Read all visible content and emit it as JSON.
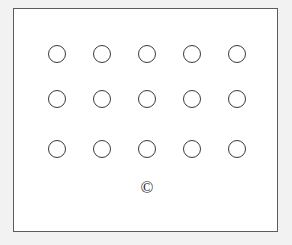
{
  "page": {
    "background_color": "#f2f2f2",
    "width": 292,
    "height": 245
  },
  "frame": {
    "name": "diagram-frame",
    "border_color": "#5c5c5c",
    "fill_color": "#ffffff",
    "left": 13,
    "top": 8,
    "width": 265,
    "height": 224
  },
  "circle_grid": {
    "rows": 3,
    "columns": 5,
    "total_circles": 15,
    "circle_diameter": 18,
    "stroke_color": "#3a3a3a",
    "fill_color": "none",
    "column_centers_x": [
      43,
      88,
      133,
      178,
      223
    ],
    "row_centers_y": [
      45,
      90,
      140
    ],
    "circles": [
      {
        "id": "circle-r1-c1",
        "row": 1,
        "col": 1,
        "cx": 43,
        "cy": 45,
        "label": ""
      },
      {
        "id": "circle-r1-c2",
        "row": 1,
        "col": 2,
        "cx": 88,
        "cy": 45,
        "label": ""
      },
      {
        "id": "circle-r1-c3",
        "row": 1,
        "col": 3,
        "cx": 133,
        "cy": 45,
        "label": ""
      },
      {
        "id": "circle-r1-c4",
        "row": 1,
        "col": 4,
        "cx": 178,
        "cy": 45,
        "label": ""
      },
      {
        "id": "circle-r1-c5",
        "row": 1,
        "col": 5,
        "cx": 223,
        "cy": 45,
        "label": ""
      },
      {
        "id": "circle-r2-c1",
        "row": 2,
        "col": 1,
        "cx": 43,
        "cy": 90,
        "label": ""
      },
      {
        "id": "circle-r2-c2",
        "row": 2,
        "col": 2,
        "cx": 88,
        "cy": 90,
        "label": ""
      },
      {
        "id": "circle-r2-c3",
        "row": 2,
        "col": 3,
        "cx": 133,
        "cy": 90,
        "label": ""
      },
      {
        "id": "circle-r2-c4",
        "row": 2,
        "col": 4,
        "cx": 178,
        "cy": 90,
        "label": ""
      },
      {
        "id": "circle-r2-c5",
        "row": 2,
        "col": 5,
        "cx": 223,
        "cy": 90,
        "label": ""
      },
      {
        "id": "circle-r3-c1",
        "row": 3,
        "col": 1,
        "cx": 43,
        "cy": 140,
        "label": ""
      },
      {
        "id": "circle-r3-c2",
        "row": 3,
        "col": 2,
        "cx": 88,
        "cy": 140,
        "label": ""
      },
      {
        "id": "circle-r3-c3",
        "row": 3,
        "col": 3,
        "cx": 133,
        "cy": 140,
        "label": ""
      },
      {
        "id": "circle-r3-c4",
        "row": 3,
        "col": 4,
        "cx": 178,
        "cy": 140,
        "label": ""
      },
      {
        "id": "circle-r3-c5",
        "row": 3,
        "col": 5,
        "cx": 223,
        "cy": 140,
        "label": ""
      }
    ]
  },
  "copyright": {
    "name": "copyright-symbol",
    "symbol": "©",
    "cx": 133,
    "cy": 178,
    "color": "#1a1a1a"
  }
}
